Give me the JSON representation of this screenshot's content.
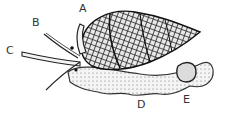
{
  "figure": {
    "labels": [
      {
        "id": "A",
        "text": "A",
        "x": 79,
        "y": 3
      },
      {
        "id": "B",
        "text": "B",
        "x": 32,
        "y": 17
      },
      {
        "id": "C",
        "text": "C",
        "x": 6,
        "y": 45
      },
      {
        "id": "D",
        "text": "D",
        "x": 137,
        "y": 99
      },
      {
        "id": "E",
        "text": "E",
        "x": 183,
        "y": 94
      }
    ],
    "colors": {
      "ink": "#222222",
      "shell_light": "#bdbdbd",
      "body": "#f2f2f2"
    }
  }
}
